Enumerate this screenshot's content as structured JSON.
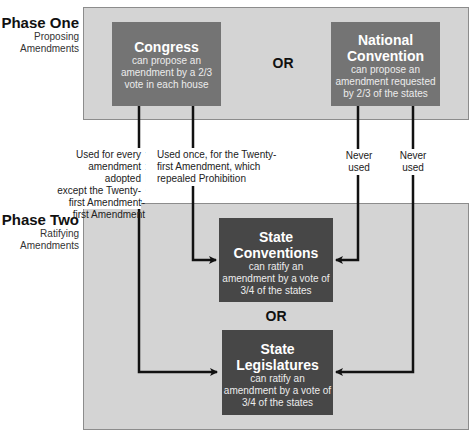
{
  "phase_one": {
    "title": "Phase One",
    "subtitle_line1": "Proposing",
    "subtitle_line2": "Amendments",
    "or_label": "OR",
    "congress": {
      "title": "Congress",
      "desc_line1": "can propose an",
      "desc_line2": "amendment by a 2/3",
      "desc_line3": "vote in each house"
    },
    "national_convention": {
      "title_line1": "National",
      "title_line2": "Convention",
      "desc_line1": "can propose an",
      "desc_line2": "amendment requested",
      "desc_line3": "by 2/3 of the states"
    }
  },
  "path_labels": {
    "congress_to_legislatures": {
      "line1": "Used for every",
      "line2": "amendment adopted",
      "line3": "except the Twenty-",
      "line4": "first Amendment"
    },
    "congress_to_conventions": {
      "line1": "Used once, for the Twenty-",
      "line2": "first Amendment, which",
      "line3": "repealed Prohibition"
    },
    "convention_to_conventions": {
      "line1": "Never",
      "line2": "used"
    },
    "convention_to_legislatures": {
      "line1": "Never",
      "line2": "used"
    }
  },
  "phase_two": {
    "title": "Phase Two",
    "subtitle_line1": "Ratifying",
    "subtitle_line2": "Amendments",
    "or_label": "OR",
    "state_conventions": {
      "title_line1": "State",
      "title_line2": "Conventions",
      "desc_line1": "can ratify an",
      "desc_line2": "amendment by a vote of",
      "desc_line3": "3/4 of the states"
    },
    "state_legislatures": {
      "title_line1": "State",
      "title_line2": "Legislatures",
      "desc_line1": "can ratify an",
      "desc_line2": "amendment by a vote of",
      "desc_line3": "3/4 of the states"
    }
  },
  "colors": {
    "panel_bg": "#d4d4d4",
    "proposal_box": "#747474",
    "ratify_box": "#474747",
    "arrow": "#111111"
  }
}
